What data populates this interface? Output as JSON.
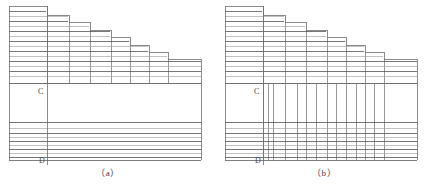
{
  "figure": {
    "title": "",
    "panels": [
      {
        "id": "a",
        "caption": "（a）",
        "labels": [
          {
            "text": "C",
            "x": 38,
            "y": 88
          },
          {
            "text": "D",
            "x": 39,
            "y": 157
          }
        ]
      },
      {
        "id": "b",
        "caption": "（b）",
        "labels": [
          {
            "text": "C",
            "x": 38,
            "y": 88
          },
          {
            "text": "D",
            "x": 39,
            "y": 157
          }
        ]
      }
    ]
  },
  "chart_data": {
    "type": "diagram",
    "colors": {
      "line_dark": "#4a4a4a",
      "line_mid": "#6e6e6e",
      "line_light": "#9a9a9a",
      "background": "#ffffff",
      "text": "#4a4a4a"
    },
    "geometry": {
      "panel_width": 216,
      "panel_height": 190,
      "left_edge": 9,
      "right_edge": 201,
      "top_edge": 6,
      "mid_boundary_y": 83,
      "lower_band_top_y": 122,
      "bottom_edge_y": 160,
      "vertical_marker_x": 47
    },
    "staircase_steps": [
      {
        "x_start": 9,
        "x_end": 47,
        "top_y": 6
      },
      {
        "x_start": 47,
        "x_end": 69,
        "top_y": 15
      },
      {
        "x_start": 69,
        "x_end": 90,
        "top_y": 22
      },
      {
        "x_start": 90,
        "x_end": 111,
        "top_y": 30
      },
      {
        "x_start": 111,
        "x_end": 130,
        "top_y": 37
      },
      {
        "x_start": 130,
        "x_end": 149,
        "top_y": 45
      },
      {
        "x_start": 149,
        "x_end": 168,
        "top_y": 52
      },
      {
        "x_start": 168,
        "x_end": 201,
        "top_y": 59
      }
    ],
    "upper_strata_y": [
      11,
      16,
      21,
      26,
      31,
      36,
      41,
      46,
      51,
      56,
      61,
      66,
      71,
      76,
      83
    ],
    "lower_strata_y": [
      122,
      128,
      133,
      137,
      141,
      145,
      149,
      153,
      157,
      160
    ],
    "panel_b_vertical_x": [
      47,
      52,
      57,
      69,
      81,
      90,
      100,
      111,
      120,
      130,
      140,
      149,
      158,
      168
    ],
    "panel_b_vertical_span": {
      "from_y": 83,
      "to_y": 160
    }
  }
}
